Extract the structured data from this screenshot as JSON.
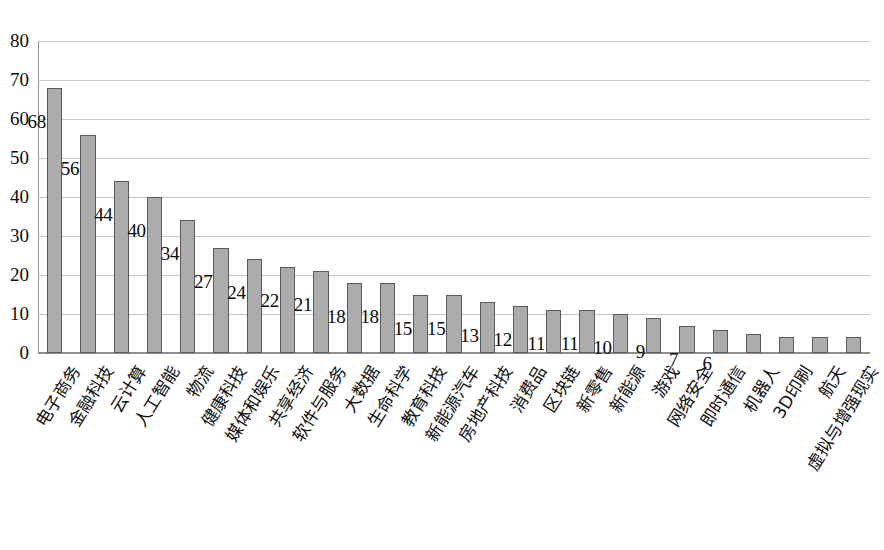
{
  "chart_data": {
    "type": "bar",
    "title": "",
    "subtitle": "",
    "xlabel": "",
    "ylabel": "",
    "ylim": [
      0,
      80
    ],
    "ytick_step": 10,
    "yticks": [
      "0",
      "10",
      "20",
      "30",
      "40",
      "50",
      "60",
      "70",
      "80"
    ],
    "grid": true,
    "legend": "none",
    "orientation": "vertical",
    "bar_color": "#acacac",
    "bar_border_color": "#5a5a5a",
    "gridline_color": "#c8c8c8",
    "axis_color": "#8d8d8d",
    "categories": [
      "电子商务",
      "金融科技",
      "云计算",
      "人工智能",
      "物流",
      "健康科技",
      "媒体和娱乐",
      "共享经济",
      "软件与服务",
      "大数据",
      "生命科学",
      "教育科技",
      "新能源汽车",
      "房地产科技",
      "消费品",
      "区块链",
      "新零售",
      "新能源",
      "游戏",
      "网络安全",
      "即时通信",
      "机器人",
      "3D印刷",
      "航天",
      "虚拟与增强现实"
    ],
    "values": [
      68,
      56,
      44,
      40,
      34,
      27,
      24,
      22,
      21,
      18,
      18,
      15,
      15,
      13,
      12,
      11,
      11,
      10,
      9,
      7,
      6,
      5,
      4,
      4,
      4
    ],
    "data_labels": [
      "68",
      "56",
      "44",
      "40",
      "34",
      "27",
      "24",
      "22",
      "21",
      "18",
      "18",
      "15",
      "15",
      "13",
      "12",
      "11",
      "11",
      "10",
      "9",
      "7",
      "6",
      "",
      "",
      "",
      ""
    ]
  }
}
